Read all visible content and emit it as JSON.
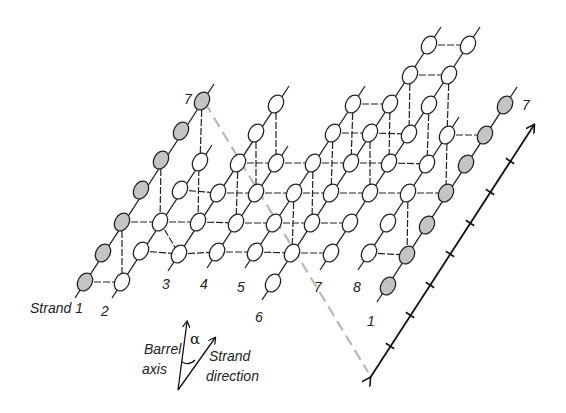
{
  "diagram": {
    "colors": {
      "node_fill_open": "#ffffff",
      "node_fill_shaded": "#c4c4c4",
      "node_stroke": "#222222",
      "strand_line": "#222222",
      "hbond_dash": "#222222",
      "seam_dash": "#b8b8b8",
      "axis_line": "#111111"
    },
    "strand_labels": [
      {
        "text": "Strand 1",
        "x": 30,
        "y": 313
      },
      {
        "text": "2",
        "x": 101,
        "y": 316
      },
      {
        "text": "3",
        "x": 162,
        "y": 289
      },
      {
        "text": "4",
        "x": 200,
        "y": 289
      },
      {
        "text": "5",
        "x": 237,
        "y": 292
      },
      {
        "text": "6",
        "x": 255,
        "y": 322
      },
      {
        "text": "7",
        "x": 314,
        "y": 292
      },
      {
        "text": "8",
        "x": 353,
        "y": 292
      },
      {
        "text": "1",
        "x": 367,
        "y": 326
      },
      {
        "text": "7",
        "x": 184,
        "y": 104
      },
      {
        "text": "7",
        "x": 522,
        "y": 110
      }
    ],
    "legend": {
      "barrel_axis_line1": "Barrel",
      "barrel_axis_line2": "axis",
      "strand_dir_line1": "Strand",
      "strand_dir_line2": "direction",
      "angle_symbol": "α"
    }
  },
  "nodes": [
    {
      "strand": "1",
      "x": 85,
      "y": 282,
      "shaded": true
    },
    {
      "strand": "1",
      "x": 103,
      "y": 253,
      "shaded": true
    },
    {
      "strand": "1",
      "x": 122,
      "y": 222,
      "shaded": true
    },
    {
      "strand": "1",
      "x": 141,
      "y": 190,
      "shaded": true
    },
    {
      "strand": "1",
      "x": 161,
      "y": 160,
      "shaded": true
    },
    {
      "strand": "1",
      "x": 181,
      "y": 131,
      "shaded": true
    },
    {
      "strand": "1",
      "x": 202,
      "y": 101,
      "shaded": true
    },
    {
      "strand": "2",
      "x": 122,
      "y": 282,
      "shaded": false
    },
    {
      "strand": "2",
      "x": 141,
      "y": 251,
      "shaded": false
    },
    {
      "strand": "2",
      "x": 160,
      "y": 222,
      "shaded": false
    },
    {
      "strand": "2",
      "x": 180,
      "y": 190,
      "shaded": false
    },
    {
      "strand": "2",
      "x": 200,
      "y": 162,
      "shaded": false
    },
    {
      "strand": "3",
      "x": 179,
      "y": 254,
      "shaded": false
    },
    {
      "strand": "3",
      "x": 198,
      "y": 222,
      "shaded": false
    },
    {
      "strand": "3",
      "x": 218,
      "y": 193,
      "shaded": false
    },
    {
      "strand": "3",
      "x": 238,
      "y": 163,
      "shaded": false
    },
    {
      "strand": "3",
      "x": 256,
      "y": 133,
      "shaded": false
    },
    {
      "strand": "3",
      "x": 276,
      "y": 104,
      "shaded": false
    },
    {
      "strand": "4",
      "x": 217,
      "y": 252,
      "shaded": false
    },
    {
      "strand": "4",
      "x": 236,
      "y": 223,
      "shaded": false
    },
    {
      "strand": "4",
      "x": 256,
      "y": 193,
      "shaded": false
    },
    {
      "strand": "4",
      "x": 276,
      "y": 163,
      "shaded": false
    },
    {
      "strand": "5",
      "x": 255,
      "y": 252,
      "shaded": false
    },
    {
      "strand": "5",
      "x": 274,
      "y": 223,
      "shaded": false
    },
    {
      "strand": "5",
      "x": 294,
      "y": 193,
      "shaded": false
    },
    {
      "strand": "5",
      "x": 313,
      "y": 163,
      "shaded": false
    },
    {
      "strand": "5",
      "x": 333,
      "y": 133,
      "shaded": false
    },
    {
      "strand": "5",
      "x": 353,
      "y": 104,
      "shaded": false
    },
    {
      "strand": "6",
      "x": 273,
      "y": 283,
      "shaded": false
    },
    {
      "strand": "6",
      "x": 292,
      "y": 253,
      "shaded": false
    },
    {
      "strand": "6",
      "x": 312,
      "y": 223,
      "shaded": false
    },
    {
      "strand": "6",
      "x": 331,
      "y": 193,
      "shaded": false
    },
    {
      "strand": "6",
      "x": 351,
      "y": 163,
      "shaded": false
    },
    {
      "strand": "6",
      "x": 370,
      "y": 133,
      "shaded": false
    },
    {
      "strand": "6",
      "x": 390,
      "y": 104,
      "shaded": false
    },
    {
      "strand": "6",
      "x": 410,
      "y": 75,
      "shaded": false
    },
    {
      "strand": "6",
      "x": 429,
      "y": 45,
      "shaded": false
    },
    {
      "strand": "7",
      "x": 331,
      "y": 253,
      "shaded": false
    },
    {
      "strand": "7",
      "x": 350,
      "y": 223,
      "shaded": false
    },
    {
      "strand": "7",
      "x": 370,
      "y": 193,
      "shaded": false
    },
    {
      "strand": "7",
      "x": 389,
      "y": 163,
      "shaded": false
    },
    {
      "strand": "7",
      "x": 409,
      "y": 134,
      "shaded": false
    },
    {
      "strand": "7",
      "x": 429,
      "y": 105,
      "shaded": false
    },
    {
      "strand": "7",
      "x": 449,
      "y": 75,
      "shaded": false
    },
    {
      "strand": "7",
      "x": 468,
      "y": 45,
      "shaded": false
    },
    {
      "strand": "8",
      "x": 369,
      "y": 253,
      "shaded": false
    },
    {
      "strand": "8",
      "x": 388,
      "y": 223,
      "shaded": false
    },
    {
      "strand": "8",
      "x": 408,
      "y": 193,
      "shaded": false
    },
    {
      "strand": "8",
      "x": 427,
      "y": 164,
      "shaded": false
    },
    {
      "strand": "8",
      "x": 447,
      "y": 135,
      "shaded": false
    },
    {
      "strand": "1'",
      "x": 388,
      "y": 286,
      "shaded": true
    },
    {
      "strand": "1'",
      "x": 407,
      "y": 255,
      "shaded": true
    },
    {
      "strand": "1'",
      "x": 427,
      "y": 225,
      "shaded": true
    },
    {
      "strand": "1'",
      "x": 446,
      "y": 193,
      "shaded": true
    },
    {
      "strand": "1'",
      "x": 466,
      "y": 164,
      "shaded": true
    },
    {
      "strand": "1'",
      "x": 485,
      "y": 135,
      "shaded": true
    },
    {
      "strand": "1'",
      "x": 505,
      "y": 105,
      "shaded": true
    }
  ],
  "strand_lines": [
    {
      "x1": 75,
      "y1": 298,
      "x2": 214,
      "y2": 84
    },
    {
      "x1": 112,
      "y1": 298,
      "x2": 212,
      "y2": 145
    },
    {
      "x1": 168,
      "y1": 271,
      "x2": 289,
      "y2": 86
    },
    {
      "x1": 207,
      "y1": 268,
      "x2": 288,
      "y2": 146
    },
    {
      "x1": 245,
      "y1": 268,
      "x2": 365,
      "y2": 86
    },
    {
      "x1": 262,
      "y1": 300,
      "x2": 441,
      "y2": 27
    },
    {
      "x1": 320,
      "y1": 270,
      "x2": 480,
      "y2": 27
    },
    {
      "x1": 358,
      "y1": 270,
      "x2": 459,
      "y2": 117
    },
    {
      "x1": 377,
      "y1": 302,
      "x2": 517,
      "y2": 87
    }
  ],
  "hbonds": [
    [
      85,
      282,
      122,
      282
    ],
    [
      122,
      222,
      160,
      222
    ],
    [
      160,
      222,
      198,
      222
    ],
    [
      141,
      251,
      179,
      254
    ],
    [
      179,
      254,
      217,
      252
    ],
    [
      198,
      222,
      236,
      223
    ],
    [
      180,
      190,
      218,
      193
    ],
    [
      218,
      193,
      256,
      193
    ],
    [
      217,
      252,
      255,
      252
    ],
    [
      236,
      223,
      274,
      223
    ],
    [
      256,
      193,
      294,
      193
    ],
    [
      238,
      163,
      276,
      163
    ],
    [
      276,
      163,
      313,
      163
    ],
    [
      255,
      252,
      292,
      253
    ],
    [
      274,
      223,
      312,
      223
    ],
    [
      294,
      193,
      331,
      193
    ],
    [
      313,
      163,
      351,
      163
    ],
    [
      333,
      133,
      370,
      133
    ],
    [
      353,
      104,
      390,
      104
    ],
    [
      410,
      75,
      449,
      75
    ],
    [
      429,
      45,
      468,
      45
    ],
    [
      292,
      253,
      331,
      253
    ],
    [
      312,
      223,
      350,
      223
    ],
    [
      351,
      163,
      389,
      163
    ],
    [
      370,
      133,
      409,
      134
    ],
    [
      331,
      193,
      370,
      193
    ],
    [
      369,
      253,
      407,
      255
    ],
    [
      370,
      193,
      408,
      193
    ],
    [
      389,
      163,
      427,
      164
    ],
    [
      408,
      193,
      446,
      193
    ],
    [
      447,
      135,
      485,
      135
    ],
    [
      122,
      282,
      122,
      282
    ]
  ],
  "vbonds": [
    [
      103,
      253,
      103,
      253
    ],
    [
      122,
      222,
      122,
      282
    ],
    [
      161,
      160,
      160,
      222
    ],
    [
      202,
      101,
      200,
      162
    ],
    [
      160,
      222,
      179,
      254
    ],
    [
      199,
      160,
      198,
      222
    ],
    [
      238,
      163,
      236,
      223
    ],
    [
      256,
      133,
      256,
      193
    ],
    [
      276,
      104,
      276,
      163
    ],
    [
      294,
      193,
      292,
      253
    ],
    [
      313,
      163,
      312,
      223
    ],
    [
      333,
      133,
      331,
      193
    ],
    [
      353,
      104,
      351,
      163
    ],
    [
      370,
      133,
      370,
      193
    ],
    [
      410,
      75,
      409,
      134
    ],
    [
      390,
      104,
      389,
      163
    ],
    [
      429,
      105,
      427,
      164
    ],
    [
      449,
      75,
      447,
      135
    ],
    [
      350,
      223,
      350,
      223
    ],
    [
      408,
      193,
      407,
      255
    ],
    [
      447,
      135,
      446,
      193
    ]
  ],
  "seam": {
    "x1": 205,
    "y1": 103,
    "x2": 368,
    "y2": 372
  },
  "axis": {
    "x1": 370,
    "y1": 378,
    "x2": 534,
    "y2": 125,
    "ticks": [
      [
        390,
        346
      ],
      [
        410,
        315
      ],
      [
        430,
        285
      ],
      [
        450,
        254
      ],
      [
        470,
        223
      ],
      [
        490,
        192
      ],
      [
        510,
        161
      ]
    ]
  },
  "legend_arrows": {
    "origin": [
      178,
      390
    ],
    "barrel_axis_tip": [
      187,
      322
    ],
    "strand_tip": [
      215,
      338
    ]
  }
}
